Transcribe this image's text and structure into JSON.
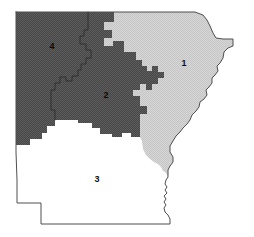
{
  "figure": {
    "kind": "choropleth-map",
    "background_color": "#ffffff",
    "width": 254,
    "height": 237
  },
  "map": {
    "outline_color": "#4f4f4f",
    "internal_border_color": "#2a2a2a",
    "districts": [
      {
        "id": "district-1",
        "label": "1",
        "fill_color": "#d3d3d3",
        "pattern": "light-dither",
        "label_x": 184,
        "label_y": 64
      },
      {
        "id": "district-2",
        "label": "2",
        "fill_color": "#4a4a4a",
        "pattern": "dark-dither",
        "label_x": 106,
        "label_y": 96
      },
      {
        "id": "district-3",
        "label": "3",
        "fill_color": "#ffffff",
        "pattern": "none",
        "label_x": 97,
        "label_y": 180
      },
      {
        "id": "district-4",
        "label": "4",
        "fill_color": "#4a4a4a",
        "pattern": "dark-dither",
        "label_x": 52,
        "label_y": 47
      }
    ]
  }
}
